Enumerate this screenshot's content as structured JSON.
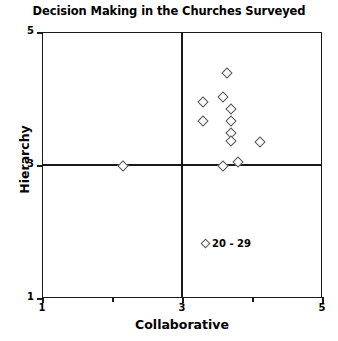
{
  "chart_data": {
    "type": "scatter",
    "title": "Decision Making in the Churches Surveyed",
    "xlabel": "Collaborative",
    "ylabel": "Hierarchy",
    "xlim": [
      1,
      5
    ],
    "ylim": [
      1,
      5
    ],
    "xticks": [
      1,
      3,
      5
    ],
    "xtick_labels": [
      "1",
      "3",
      "5"
    ],
    "yticks": [
      1,
      3,
      5
    ],
    "ytick_labels": [
      "1",
      "3",
      "5"
    ],
    "xminor_ticks": [
      2,
      4
    ],
    "yminor_ticks": [],
    "grid": false,
    "quadrant_lines": {
      "x": 3,
      "y": 3
    },
    "legend": {
      "position": "inside-bottom-right",
      "entries": [
        {
          "label": "20 - 29",
          "marker": "diamond"
        }
      ]
    },
    "series": [
      {
        "name": "20 - 29",
        "marker": "diamond",
        "marker_face_color": "#fbfbfb",
        "marker_edge_color": "#555555",
        "points": [
          {
            "x": 3.63,
            "y": 4.4
          },
          {
            "x": 3.57,
            "y": 4.04
          },
          {
            "x": 3.29,
            "y": 3.96
          },
          {
            "x": 3.69,
            "y": 3.85
          },
          {
            "x": 3.29,
            "y": 3.68
          },
          {
            "x": 3.69,
            "y": 3.68
          },
          {
            "x": 3.69,
            "y": 3.5
          },
          {
            "x": 3.69,
            "y": 3.37
          },
          {
            "x": 4.1,
            "y": 3.36
          },
          {
            "x": 3.79,
            "y": 3.06
          },
          {
            "x": 3.57,
            "y": 3.0
          },
          {
            "x": 2.14,
            "y": 3.0
          }
        ]
      }
    ]
  },
  "legend": {
    "marker_icon": "diamond-marker-icon",
    "label": "20 - 29"
  }
}
